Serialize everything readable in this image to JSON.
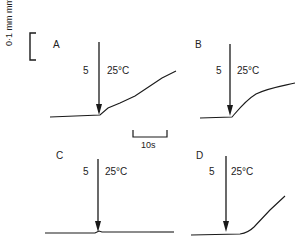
{
  "figure": {
    "scale_bar": {
      "vertical_label": "0·1 mm mm",
      "vertical_label_exponent": "-1",
      "horizontal_label": "10s"
    },
    "panels": [
      {
        "letter": "A",
        "stimulus_label_left": "5",
        "stimulus_label_right": "25°C"
      },
      {
        "letter": "B",
        "stimulus_label_left": "5",
        "stimulus_label_right": "25°C"
      },
      {
        "letter": "C",
        "stimulus_label_left": "5",
        "stimulus_label_right": "25°C"
      },
      {
        "letter": "D",
        "stimulus_label_left": "5",
        "stimulus_label_right": "25°C"
      }
    ],
    "colors": {
      "ink": "#1a1a1a",
      "background": "#ffffff"
    }
  }
}
